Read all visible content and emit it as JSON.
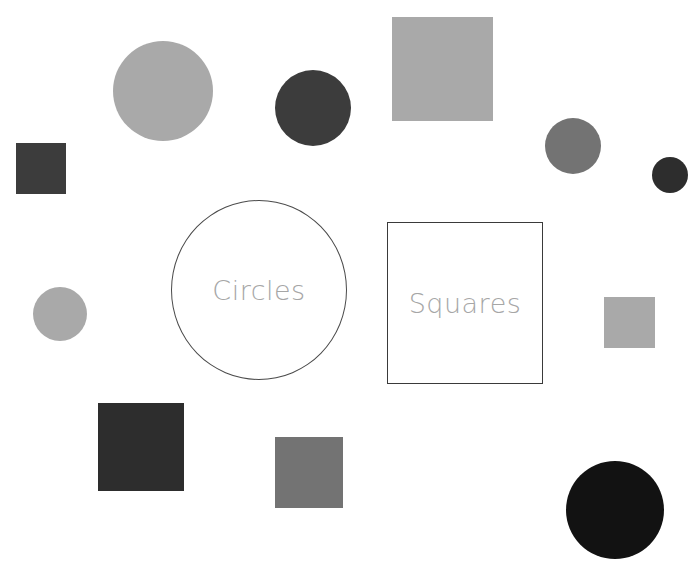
{
  "worksheet": {
    "top_fragment_text": "",
    "sort_targets": [
      {
        "id": "circles",
        "label": "Circles",
        "kind": "circle-outline"
      },
      {
        "id": "squares",
        "label": "Squares",
        "kind": "square-outline"
      }
    ],
    "colors": {
      "light_gray": "#a9a9a9",
      "medium_gray": "#737373",
      "dark_gray": "#3c3c3c",
      "very_dark_gray": "#2d2d2d",
      "black": "#121212",
      "outline": "#444444",
      "label_text": "#a6a6a6"
    },
    "shapes": [
      {
        "type": "circle",
        "name": "large-light-circle",
        "cx": 163,
        "cy": 91,
        "r": 50,
        "color": "#a9a9a9"
      },
      {
        "type": "circle",
        "name": "dark-circle-top",
        "cx": 313,
        "cy": 108,
        "r": 38,
        "color": "#3c3c3c"
      },
      {
        "type": "square",
        "name": "light-square-top",
        "x": 392,
        "y": 17,
        "w": 101,
        "h": 104,
        "color": "#a9a9a9"
      },
      {
        "type": "circle",
        "name": "medium-circle-right",
        "cx": 573,
        "cy": 146,
        "r": 28,
        "color": "#737373"
      },
      {
        "type": "circle",
        "name": "dark-circle-edge",
        "cx": 670,
        "cy": 175,
        "r": 18,
        "color": "#2d2d2d"
      },
      {
        "type": "square",
        "name": "dark-square-left",
        "x": 16,
        "y": 143,
        "w": 50,
        "h": 51,
        "color": "#3c3c3c"
      },
      {
        "type": "circle",
        "name": "light-circle-left",
        "cx": 60,
        "cy": 314,
        "r": 27,
        "color": "#a9a9a9"
      },
      {
        "type": "square",
        "name": "light-square-right",
        "x": 604,
        "y": 297,
        "w": 51,
        "h": 51,
        "color": "#a9a9a9"
      },
      {
        "type": "square",
        "name": "dark-square-bottom",
        "x": 98,
        "y": 403,
        "w": 86,
        "h": 88,
        "color": "#2d2d2d"
      },
      {
        "type": "square",
        "name": "medium-square-bottom",
        "x": 275,
        "y": 437,
        "w": 68,
        "h": 71,
        "color": "#737373"
      },
      {
        "type": "circle",
        "name": "black-circle-bottom",
        "cx": 615,
        "cy": 510,
        "r": 49,
        "color": "#121212"
      }
    ]
  }
}
